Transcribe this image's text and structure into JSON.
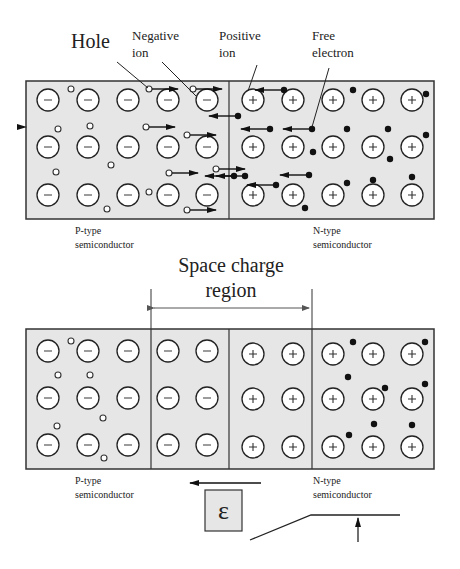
{
  "top_diagram": {
    "labels": {
      "hole": "Hole",
      "negative_ion_1": "Negative",
      "negative_ion_2": "ion",
      "positive_ion_1": "Positive",
      "positive_ion_2": "ion",
      "free_electron_1": "Free",
      "free_electron_2": "electron",
      "p_type_1": "P-type",
      "p_type_2": "semiconductor",
      "n_type_1": "N-type",
      "n_type_2": "semiconductor"
    }
  },
  "space_charge": {
    "label_1": "Space charge",
    "label_2": "region"
  },
  "bottom_diagram": {
    "labels": {
      "p_type_1": "P-type",
      "p_type_2": "semiconductor",
      "n_type_1": "N-type",
      "n_type_2": "semiconductor",
      "field_symbol": "ε"
    }
  },
  "colors": {
    "box_fill": "#e6e6e6",
    "stroke": "#333333",
    "ion_fill": "#ffffff",
    "electron": "#111111"
  },
  "ion_symbols": {
    "negative": "−",
    "positive": "+"
  }
}
